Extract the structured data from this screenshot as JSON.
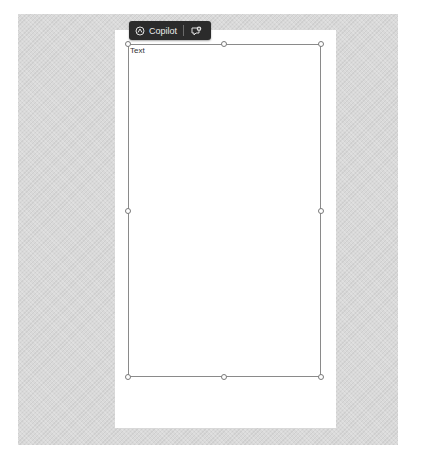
{
  "canvas": {
    "background_color": "#d9d9d9",
    "page_color": "#ffffff"
  },
  "toolbar": {
    "copilot": {
      "icon": "copilot-icon",
      "label": "Copilot"
    },
    "comment": {
      "icon": "new-comment-icon"
    },
    "background_color": "#2b2b2b"
  },
  "textbox": {
    "content": "Text",
    "handles": [
      "top-left",
      "top-center",
      "top-right",
      "middle-left",
      "middle-right",
      "bottom-left",
      "bottom-center",
      "bottom-right"
    ]
  }
}
